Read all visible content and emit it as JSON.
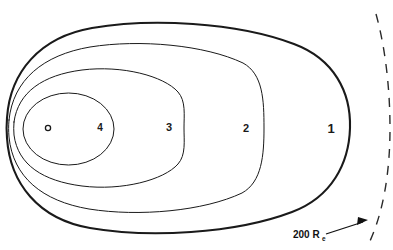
{
  "figure": {
    "background_color": "#ffffff",
    "line_color": "#1a1a1a",
    "width": 393,
    "height": 250
  },
  "central_body": {
    "name": "central-body-marker",
    "shape": "small-open-circle",
    "cx": 48,
    "cy": 128,
    "r": 2.6
  },
  "contours": [
    {
      "id": "contour-1",
      "label": "1",
      "label_x": 331,
      "label_y": 133,
      "label_size": 13,
      "stroke_width": 2.1,
      "nose_x": 350,
      "tail_x": 7,
      "top_y": 25,
      "bottom_y": 226
    },
    {
      "id": "contour-2",
      "label": "2",
      "label_x": 246,
      "label_y": 132,
      "label_size": 11,
      "stroke_width": 1.0,
      "nose_x": 264,
      "tail_x": 9,
      "top_y": 45,
      "bottom_y": 211
    },
    {
      "id": "contour-3",
      "label": "3",
      "label_x": 169,
      "label_y": 131,
      "label_size": 11,
      "stroke_width": 1.0,
      "nose_x": 184,
      "tail_x": 14,
      "top_y": 69,
      "bottom_y": 195
    },
    {
      "id": "contour-4",
      "label": "4",
      "label_x": 100,
      "label_y": 131,
      "label_size": 10,
      "stroke_width": 1.0,
      "nose_x": 114,
      "tail_x": 23,
      "top_y": 93,
      "bottom_y": 165
    }
  ],
  "boundary": {
    "id": "dashed-boundary",
    "style": "dashed",
    "dash_pattern": "9 8",
    "stroke_width": 1.4,
    "top_x": 376,
    "top_y": 14,
    "mid_x": 390,
    "mid_y": 128,
    "bottom_x": 370,
    "bottom_y": 241
  },
  "annotation": {
    "id": "boundary-annotation",
    "text": "200 R",
    "subscript": "e",
    "text_x": 293,
    "text_y": 238,
    "sub_x": 322,
    "sub_y": 241,
    "arrow": {
      "from_x": 326,
      "from_y": 234,
      "to_x": 367,
      "to_y": 221
    }
  }
}
